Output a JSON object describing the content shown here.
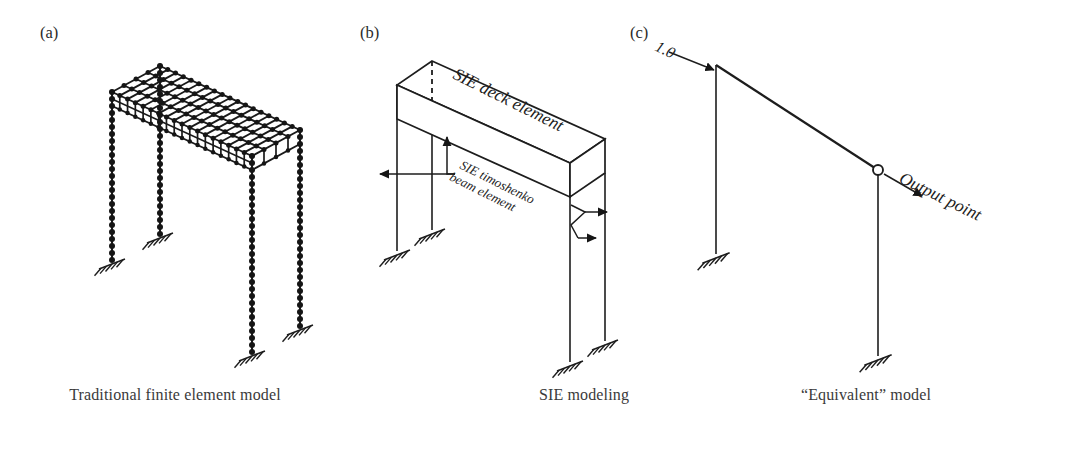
{
  "figure": {
    "background_color": "#ffffff",
    "ink_color": "#1d1d1d",
    "width": 1076,
    "height": 450
  },
  "panels": [
    {
      "id": "a",
      "label": "(a)",
      "label_pos": [
        40,
        38
      ],
      "caption": "Traditional finite element model",
      "caption_pos": [
        175,
        400
      ],
      "description": "Isometric three-dimensional bridge discretized with a dense finite element mesh deck and four nodal columns on fixed supports."
    },
    {
      "id": "b",
      "label": "(b)",
      "label_pos": [
        360,
        38
      ],
      "caption": "SIE modeling",
      "caption_pos": [
        584,
        400
      ],
      "description": "Isometric bridge with a single solid deck element and four line beam elements on fixed supports."
    },
    {
      "id": "c",
      "label": "(c)",
      "label_pos": [
        630,
        38
      ],
      "caption": "“Equivalent” model",
      "caption_pos": [
        866,
        400
      ],
      "description": "Simplified two column equivalent frame with unit load applied at the top of the left column and an output point at the right joint."
    }
  ],
  "annotations": {
    "deck_element": {
      "text": "SIE deck element",
      "panel": "b",
      "x": 452,
      "y": 78,
      "rotation": 26.5,
      "style": "italic"
    },
    "timoshenko_beam": {
      "text_line1": "SIE timoshenko",
      "text_line2": "beam element",
      "panel": "b",
      "x": 459,
      "y": 168,
      "rotation": 26.5,
      "style": "italic"
    },
    "unit_load": {
      "text": "1.0",
      "panel": "c",
      "x": 654,
      "y": 50,
      "rotation": 26,
      "style": "italic"
    },
    "output_point": {
      "text": "Output point",
      "panel": "c",
      "x": 898,
      "y": 182,
      "rotation": 26,
      "style": "italic"
    }
  },
  "model_a": {
    "type": "finite-element-mesh",
    "deck": {
      "near_left": [
        112,
        92
      ],
      "near_right": [
        252,
        156
      ],
      "far_left": [
        160,
        66
      ],
      "far_right": [
        300,
        130
      ],
      "thickness": 14,
      "cells_long": 18,
      "cells_trans": 4,
      "node_radius": 2.5
    },
    "columns": [
      {
        "top": [
          112,
          92
        ],
        "bottom": [
          112,
          260
        ],
        "nodes": 24
      },
      {
        "top": [
          160,
          66
        ],
        "bottom": [
          160,
          234
        ],
        "nodes": 24
      },
      {
        "top": [
          252,
          156
        ],
        "bottom": [
          252,
          352
        ],
        "nodes": 28
      },
      {
        "top": [
          300,
          130
        ],
        "bottom": [
          300,
          326
        ],
        "nodes": 28
      }
    ],
    "supports": [
      {
        "x": 112,
        "y": 260
      },
      {
        "x": 160,
        "y": 234
      },
      {
        "x": 252,
        "y": 352
      },
      {
        "x": 300,
        "y": 326
      }
    ]
  },
  "model_b": {
    "type": "spectral-element",
    "deck": {
      "near_left": [
        397,
        85
      ],
      "near_right": [
        570,
        163
      ],
      "far_left": [
        432,
        61
      ],
      "far_right": [
        605,
        139
      ],
      "thickness": 34
    },
    "dashed_line": {
      "x": 432,
      "y_top": 61,
      "y_bottom": 101
    },
    "columns": [
      {
        "top": [
          397,
          85
        ],
        "bottom": [
          397,
          251
        ]
      },
      {
        "top": [
          432,
          95
        ],
        "bottom": [
          432,
          230
        ]
      },
      {
        "top": [
          570,
          197
        ],
        "bottom": [
          570,
          362
        ]
      },
      {
        "top": [
          605,
          173
        ],
        "bottom": [
          605,
          341
        ]
      }
    ],
    "supports": [
      {
        "x": 397,
        "y": 251
      },
      {
        "x": 432,
        "y": 230
      },
      {
        "x": 570,
        "y": 362
      },
      {
        "x": 605,
        "y": 341
      }
    ],
    "leaders": {
      "left": {
        "origin": [
          455,
          174
        ],
        "up_arrow_to": [
          447,
          137
        ],
        "left_arrow_to": [
          380,
          174
        ]
      },
      "right": {
        "origin": [
          573,
          222
        ],
        "bracket": [
          [
            571,
            205
          ],
          [
            585,
            212
          ],
          [
            571,
            225
          ],
          [
            578,
            238
          ]
        ],
        "right_arrow_to": [
          607,
          212
        ],
        "down_right_arrow_to": [
          596,
          238
        ]
      }
    }
  },
  "model_c": {
    "type": "equivalent-frame",
    "beam": {
      "from": [
        716,
        65
      ],
      "to": [
        878,
        170
      ]
    },
    "columns": [
      {
        "top": [
          716,
          65
        ],
        "bottom": [
          716,
          254
        ]
      },
      {
        "top": [
          878,
          170
        ],
        "bottom": [
          878,
          356
        ]
      }
    ],
    "supports": [
      {
        "x": 716,
        "y": 254
      },
      {
        "x": 878,
        "y": 356
      }
    ],
    "load_arrow": {
      "from": [
        669,
        52
      ],
      "to": [
        714,
        70
      ],
      "value": "1.0"
    },
    "output_marker": {
      "x": 878,
      "y": 170,
      "radius": 5
    },
    "output_arrow": {
      "from": [
        884,
        174
      ],
      "to": [
        922,
        196
      ]
    }
  }
}
